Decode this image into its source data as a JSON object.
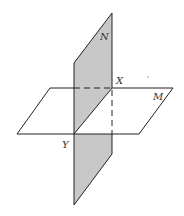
{
  "diagram": {
    "colors": {
      "plane_n_fill": "#c8c8c8",
      "plane_m_fill": "#ffffff",
      "stroke": "#222222",
      "background": "#ffffff"
    },
    "planes": [
      {
        "name": "N",
        "orientation": "vertical",
        "shaded": true
      },
      {
        "name": "M",
        "orientation": "horizontal",
        "shaded": false
      }
    ],
    "points": [
      {
        "name": "X",
        "position": "top of intersection line"
      },
      {
        "name": "Y",
        "position": "bottom of intersection line"
      }
    ],
    "labels": {
      "plane_n": "N",
      "plane_m": "M",
      "point_x": "X",
      "point_y": "Y"
    },
    "intersection": "XY"
  }
}
